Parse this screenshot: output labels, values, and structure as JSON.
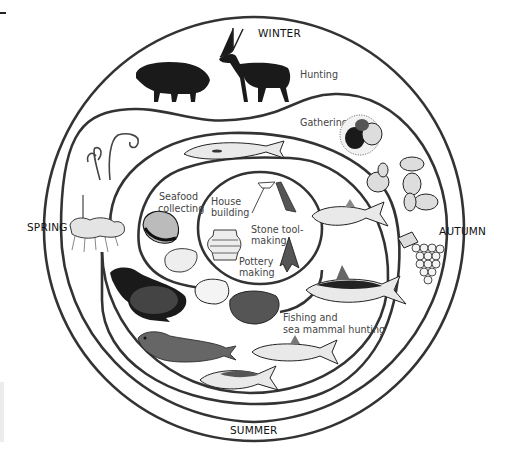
{
  "diagram": {
    "type": "seasonal-cycle",
    "seasons": {
      "top": "WINTER",
      "right": "AUTUMN",
      "bottom": "SUMMER",
      "left": "SPRING"
    },
    "activities": {
      "hunting": "Hunting",
      "gathering": "Gathering",
      "seafood_1": "Seafood",
      "seafood_2": "collecting",
      "house_1": "House",
      "house_2": "building",
      "stone_1": "Stone tool-",
      "stone_2": "making",
      "pottery_1": "Pottery",
      "pottery_2": "making",
      "fishing_1": "Fishing and",
      "fishing_2": "sea mammal hunting"
    },
    "illustrations": [
      "wild-boar",
      "deer",
      "chestnuts",
      "acorns",
      "walnut",
      "grapes",
      "fern-sprouts",
      "root-tubers",
      "salmon-top",
      "salmon-right",
      "tuna",
      "sardine",
      "mackerel",
      "seal",
      "sea-lion",
      "clam-shells",
      "abalone",
      "house-frame",
      "stone-arrowhead",
      "jomon-pot"
    ],
    "colors": {
      "line": "#333333",
      "text": "#111111",
      "activity_text": "#444444"
    }
  }
}
